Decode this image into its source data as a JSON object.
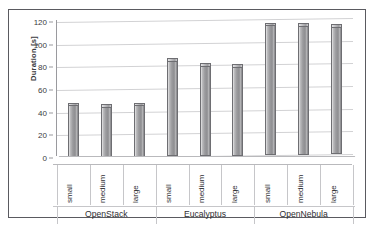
{
  "chart_data": {
    "type": "bar",
    "title": "",
    "subtitle": "",
    "xlabel": "",
    "ylabel": "Duration [s]",
    "ylim": [
      0,
      120
    ],
    "ytick_labels": [
      "0",
      "20",
      "40",
      "60",
      "80",
      "100",
      "120"
    ],
    "ytick_values": [
      0,
      20,
      40,
      60,
      80,
      100,
      120
    ],
    "grid": true,
    "legend": "none",
    "style": "3d-column-grayscale",
    "categories": [
      "small",
      "medium",
      "large",
      "small",
      "medium",
      "large",
      "small",
      "medium",
      "large"
    ],
    "values": [
      47,
      45,
      46,
      85,
      80,
      79,
      115,
      114,
      113
    ],
    "groups": [
      {
        "label": "OpenStack",
        "categories": [
          "small",
          "medium",
          "large"
        ],
        "values": [
          47,
          45,
          46
        ]
      },
      {
        "label": "Eucalyptus",
        "categories": [
          "small",
          "medium",
          "large"
        ],
        "values": [
          85,
          80,
          79
        ]
      },
      {
        "label": "OpenNebula",
        "categories": [
          "small",
          "medium",
          "large"
        ],
        "values": [
          115,
          114,
          113
        ]
      }
    ],
    "colors": {
      "bar_fill": "#9b9b9e",
      "bar_edge": "#6e6e72",
      "gridline": "#d2d2d4",
      "axis": "#9a9a9e",
      "text": "#2f2f33",
      "frame": "#5a5a60",
      "background": "#ffffff"
    }
  }
}
